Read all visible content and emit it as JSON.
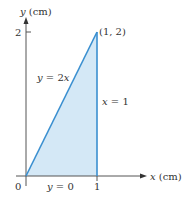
{
  "diagram": {
    "type": "region-plot",
    "axes": {
      "x_label_var": "x",
      "x_label_unit": " (cm)",
      "y_label_var": "y",
      "y_label_unit": " (cm)",
      "origin_label": "0",
      "x_tick_label": "1",
      "y_tick_label": "2"
    },
    "curves": [
      {
        "name": "diagonal",
        "label_lhs": "y",
        "label_rhs": " = 2",
        "label_var": "x",
        "from": [
          0,
          0
        ],
        "to": [
          1,
          2
        ]
      },
      {
        "name": "vertical",
        "label_lhs": "x",
        "label_rhs": " = 1",
        "from": [
          1,
          0
        ],
        "to": [
          1,
          2
        ]
      },
      {
        "name": "base",
        "label_lhs": "y",
        "label_rhs": " = 0",
        "from": [
          0,
          0
        ],
        "to": [
          1,
          0
        ]
      }
    ],
    "vertex_label": "(1, 2)",
    "colors": {
      "fill": "#d4e8f6",
      "boundary": "#3a8fd0",
      "axis": "#555555",
      "text": "#333333"
    }
  }
}
